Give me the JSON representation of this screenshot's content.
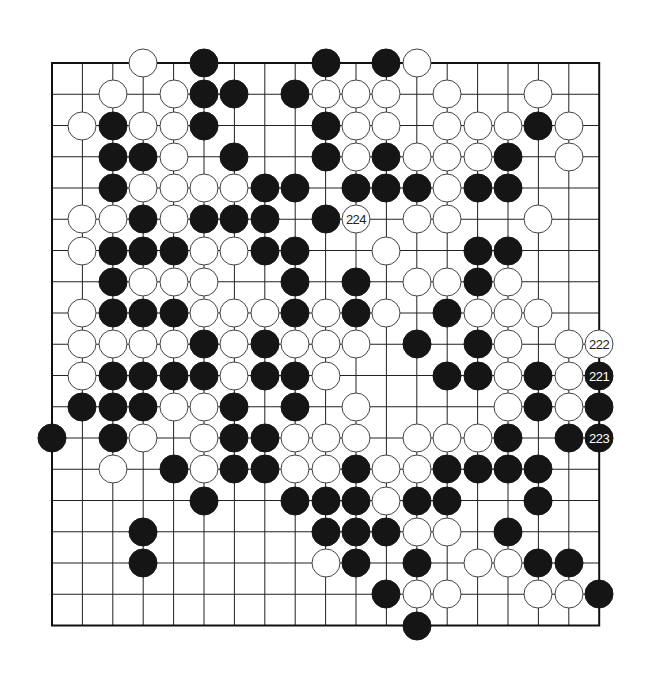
{
  "board": {
    "size": 19,
    "origin": {
      "x": 52,
      "y": 63
    },
    "spacing": {
      "x": 30.4,
      "y": 31.25
    },
    "line_color": "#222222",
    "border_color": "#111111",
    "stone_colors": {
      "black": "#151515",
      "white": "#ffffff"
    }
  },
  "stones": [
    {
      "r": 0,
      "c": 3,
      "color": "w"
    },
    {
      "r": 0,
      "c": 5,
      "color": "b"
    },
    {
      "r": 0,
      "c": 9,
      "color": "b"
    },
    {
      "r": 0,
      "c": 11,
      "color": "b"
    },
    {
      "r": 0,
      "c": 12,
      "color": "w"
    },
    {
      "r": 1,
      "c": 2,
      "color": "w"
    },
    {
      "r": 1,
      "c": 4,
      "color": "w"
    },
    {
      "r": 1,
      "c": 5,
      "color": "b"
    },
    {
      "r": 1,
      "c": 6,
      "color": "b"
    },
    {
      "r": 1,
      "c": 8,
      "color": "b"
    },
    {
      "r": 1,
      "c": 9,
      "color": "w"
    },
    {
      "r": 1,
      "c": 10,
      "color": "w"
    },
    {
      "r": 1,
      "c": 11,
      "color": "w"
    },
    {
      "r": 1,
      "c": 13,
      "color": "w"
    },
    {
      "r": 1,
      "c": 16,
      "color": "w"
    },
    {
      "r": 2,
      "c": 1,
      "color": "w"
    },
    {
      "r": 2,
      "c": 2,
      "color": "b"
    },
    {
      "r": 2,
      "c": 3,
      "color": "w"
    },
    {
      "r": 2,
      "c": 4,
      "color": "w"
    },
    {
      "r": 2,
      "c": 5,
      "color": "b"
    },
    {
      "r": 2,
      "c": 9,
      "color": "b"
    },
    {
      "r": 2,
      "c": 10,
      "color": "w"
    },
    {
      "r": 2,
      "c": 11,
      "color": "w"
    },
    {
      "r": 2,
      "c": 13,
      "color": "w"
    },
    {
      "r": 2,
      "c": 14,
      "color": "w"
    },
    {
      "r": 2,
      "c": 15,
      "color": "w"
    },
    {
      "r": 2,
      "c": 16,
      "color": "b"
    },
    {
      "r": 2,
      "c": 17,
      "color": "w"
    },
    {
      "r": 3,
      "c": 2,
      "color": "b"
    },
    {
      "r": 3,
      "c": 3,
      "color": "b"
    },
    {
      "r": 3,
      "c": 4,
      "color": "w"
    },
    {
      "r": 3,
      "c": 6,
      "color": "b"
    },
    {
      "r": 3,
      "c": 9,
      "color": "b"
    },
    {
      "r": 3,
      "c": 10,
      "color": "w"
    },
    {
      "r": 3,
      "c": 11,
      "color": "b"
    },
    {
      "r": 3,
      "c": 12,
      "color": "w"
    },
    {
      "r": 3,
      "c": 13,
      "color": "w"
    },
    {
      "r": 3,
      "c": 14,
      "color": "w"
    },
    {
      "r": 3,
      "c": 15,
      "color": "b"
    },
    {
      "r": 3,
      "c": 17,
      "color": "w"
    },
    {
      "r": 4,
      "c": 2,
      "color": "b"
    },
    {
      "r": 4,
      "c": 3,
      "color": "w"
    },
    {
      "r": 4,
      "c": 4,
      "color": "w"
    },
    {
      "r": 4,
      "c": 5,
      "color": "w"
    },
    {
      "r": 4,
      "c": 6,
      "color": "w"
    },
    {
      "r": 4,
      "c": 7,
      "color": "b"
    },
    {
      "r": 4,
      "c": 8,
      "color": "b"
    },
    {
      "r": 4,
      "c": 10,
      "color": "b"
    },
    {
      "r": 4,
      "c": 11,
      "color": "b"
    },
    {
      "r": 4,
      "c": 12,
      "color": "b"
    },
    {
      "r": 4,
      "c": 13,
      "color": "w"
    },
    {
      "r": 4,
      "c": 14,
      "color": "b"
    },
    {
      "r": 4,
      "c": 15,
      "color": "b"
    },
    {
      "r": 5,
      "c": 1,
      "color": "w"
    },
    {
      "r": 5,
      "c": 2,
      "color": "w"
    },
    {
      "r": 5,
      "c": 3,
      "color": "b"
    },
    {
      "r": 5,
      "c": 4,
      "color": "w"
    },
    {
      "r": 5,
      "c": 5,
      "color": "b"
    },
    {
      "r": 5,
      "c": 6,
      "color": "b"
    },
    {
      "r": 5,
      "c": 7,
      "color": "b"
    },
    {
      "r": 5,
      "c": 9,
      "color": "b"
    },
    {
      "r": 5,
      "c": 10,
      "color": "w",
      "label": "224"
    },
    {
      "r": 5,
      "c": 12,
      "color": "w"
    },
    {
      "r": 5,
      "c": 13,
      "color": "w"
    },
    {
      "r": 5,
      "c": 16,
      "color": "w"
    },
    {
      "r": 6,
      "c": 1,
      "color": "w"
    },
    {
      "r": 6,
      "c": 2,
      "color": "b"
    },
    {
      "r": 6,
      "c": 3,
      "color": "b"
    },
    {
      "r": 6,
      "c": 4,
      "color": "b"
    },
    {
      "r": 6,
      "c": 5,
      "color": "w"
    },
    {
      "r": 6,
      "c": 6,
      "color": "w"
    },
    {
      "r": 6,
      "c": 7,
      "color": "b"
    },
    {
      "r": 6,
      "c": 8,
      "color": "b"
    },
    {
      "r": 6,
      "c": 11,
      "color": "w"
    },
    {
      "r": 6,
      "c": 14,
      "color": "b"
    },
    {
      "r": 6,
      "c": 15,
      "color": "b"
    },
    {
      "r": 7,
      "c": 2,
      "color": "b"
    },
    {
      "r": 7,
      "c": 3,
      "color": "w"
    },
    {
      "r": 7,
      "c": 4,
      "color": "w"
    },
    {
      "r": 7,
      "c": 5,
      "color": "w"
    },
    {
      "r": 7,
      "c": 8,
      "color": "b"
    },
    {
      "r": 7,
      "c": 10,
      "color": "b"
    },
    {
      "r": 7,
      "c": 12,
      "color": "w"
    },
    {
      "r": 7,
      "c": 13,
      "color": "w"
    },
    {
      "r": 7,
      "c": 14,
      "color": "b"
    },
    {
      "r": 7,
      "c": 15,
      "color": "w"
    },
    {
      "r": 8,
      "c": 1,
      "color": "w"
    },
    {
      "r": 8,
      "c": 2,
      "color": "b"
    },
    {
      "r": 8,
      "c": 3,
      "color": "b"
    },
    {
      "r": 8,
      "c": 4,
      "color": "b"
    },
    {
      "r": 8,
      "c": 5,
      "color": "w"
    },
    {
      "r": 8,
      "c": 6,
      "color": "w"
    },
    {
      "r": 8,
      "c": 7,
      "color": "w"
    },
    {
      "r": 8,
      "c": 8,
      "color": "b"
    },
    {
      "r": 8,
      "c": 9,
      "color": "w"
    },
    {
      "r": 8,
      "c": 10,
      "color": "b"
    },
    {
      "r": 8,
      "c": 11,
      "color": "w"
    },
    {
      "r": 8,
      "c": 13,
      "color": "b"
    },
    {
      "r": 8,
      "c": 14,
      "color": "w"
    },
    {
      "r": 8,
      "c": 15,
      "color": "w"
    },
    {
      "r": 8,
      "c": 16,
      "color": "w"
    },
    {
      "r": 9,
      "c": 1,
      "color": "w"
    },
    {
      "r": 9,
      "c": 2,
      "color": "w"
    },
    {
      "r": 9,
      "c": 3,
      "color": "w"
    },
    {
      "r": 9,
      "c": 4,
      "color": "w"
    },
    {
      "r": 9,
      "c": 5,
      "color": "b"
    },
    {
      "r": 9,
      "c": 6,
      "color": "w"
    },
    {
      "r": 9,
      "c": 7,
      "color": "b"
    },
    {
      "r": 9,
      "c": 8,
      "color": "w"
    },
    {
      "r": 9,
      "c": 9,
      "color": "w"
    },
    {
      "r": 9,
      "c": 10,
      "color": "w"
    },
    {
      "r": 9,
      "c": 12,
      "color": "b"
    },
    {
      "r": 9,
      "c": 14,
      "color": "b"
    },
    {
      "r": 9,
      "c": 15,
      "color": "w"
    },
    {
      "r": 9,
      "c": 17,
      "color": "w"
    },
    {
      "r": 9,
      "c": 18,
      "color": "w",
      "label": "222"
    },
    {
      "r": 10,
      "c": 1,
      "color": "w"
    },
    {
      "r": 10,
      "c": 2,
      "color": "b"
    },
    {
      "r": 10,
      "c": 3,
      "color": "b"
    },
    {
      "r": 10,
      "c": 4,
      "color": "b"
    },
    {
      "r": 10,
      "c": 5,
      "color": "b"
    },
    {
      "r": 10,
      "c": 6,
      "color": "w"
    },
    {
      "r": 10,
      "c": 7,
      "color": "b"
    },
    {
      "r": 10,
      "c": 8,
      "color": "b"
    },
    {
      "r": 10,
      "c": 9,
      "color": "w"
    },
    {
      "r": 10,
      "c": 13,
      "color": "b"
    },
    {
      "r": 10,
      "c": 14,
      "color": "b"
    },
    {
      "r": 10,
      "c": 15,
      "color": "w"
    },
    {
      "r": 10,
      "c": 16,
      "color": "b"
    },
    {
      "r": 10,
      "c": 17,
      "color": "w"
    },
    {
      "r": 10,
      "c": 18,
      "color": "b",
      "label": "221"
    },
    {
      "r": 11,
      "c": 1,
      "color": "b"
    },
    {
      "r": 11,
      "c": 2,
      "color": "b"
    },
    {
      "r": 11,
      "c": 3,
      "color": "b"
    },
    {
      "r": 11,
      "c": 4,
      "color": "w"
    },
    {
      "r": 11,
      "c": 5,
      "color": "w"
    },
    {
      "r": 11,
      "c": 6,
      "color": "b"
    },
    {
      "r": 11,
      "c": 8,
      "color": "b"
    },
    {
      "r": 11,
      "c": 10,
      "color": "w"
    },
    {
      "r": 11,
      "c": 15,
      "color": "w"
    },
    {
      "r": 11,
      "c": 16,
      "color": "b"
    },
    {
      "r": 11,
      "c": 17,
      "color": "w"
    },
    {
      "r": 11,
      "c": 18,
      "color": "b"
    },
    {
      "r": 12,
      "c": 0,
      "color": "b"
    },
    {
      "r": 12,
      "c": 2,
      "color": "b"
    },
    {
      "r": 12,
      "c": 3,
      "color": "w"
    },
    {
      "r": 12,
      "c": 5,
      "color": "w"
    },
    {
      "r": 12,
      "c": 6,
      "color": "b"
    },
    {
      "r": 12,
      "c": 7,
      "color": "b"
    },
    {
      "r": 12,
      "c": 8,
      "color": "w"
    },
    {
      "r": 12,
      "c": 9,
      "color": "w"
    },
    {
      "r": 12,
      "c": 10,
      "color": "w"
    },
    {
      "r": 12,
      "c": 12,
      "color": "w"
    },
    {
      "r": 12,
      "c": 13,
      "color": "w"
    },
    {
      "r": 12,
      "c": 14,
      "color": "w"
    },
    {
      "r": 12,
      "c": 15,
      "color": "b"
    },
    {
      "r": 12,
      "c": 17,
      "color": "b"
    },
    {
      "r": 12,
      "c": 18,
      "color": "b",
      "label": "223"
    },
    {
      "r": 13,
      "c": 2,
      "color": "w"
    },
    {
      "r": 13,
      "c": 4,
      "color": "b"
    },
    {
      "r": 13,
      "c": 5,
      "color": "w"
    },
    {
      "r": 13,
      "c": 6,
      "color": "b"
    },
    {
      "r": 13,
      "c": 7,
      "color": "b"
    },
    {
      "r": 13,
      "c": 8,
      "color": "w"
    },
    {
      "r": 13,
      "c": 9,
      "color": "w"
    },
    {
      "r": 13,
      "c": 10,
      "color": "b"
    },
    {
      "r": 13,
      "c": 11,
      "color": "w"
    },
    {
      "r": 13,
      "c": 12,
      "color": "w"
    },
    {
      "r": 13,
      "c": 13,
      "color": "b"
    },
    {
      "r": 13,
      "c": 14,
      "color": "b"
    },
    {
      "r": 13,
      "c": 15,
      "color": "b"
    },
    {
      "r": 13,
      "c": 16,
      "color": "b"
    },
    {
      "r": 14,
      "c": 5,
      "color": "b"
    },
    {
      "r": 14,
      "c": 8,
      "color": "b"
    },
    {
      "r": 14,
      "c": 9,
      "color": "b"
    },
    {
      "r": 14,
      "c": 10,
      "color": "b"
    },
    {
      "r": 14,
      "c": 11,
      "color": "w"
    },
    {
      "r": 14,
      "c": 12,
      "color": "b"
    },
    {
      "r": 14,
      "c": 13,
      "color": "b"
    },
    {
      "r": 14,
      "c": 16,
      "color": "b"
    },
    {
      "r": 15,
      "c": 3,
      "color": "b"
    },
    {
      "r": 15,
      "c": 9,
      "color": "b"
    },
    {
      "r": 15,
      "c": 10,
      "color": "b"
    },
    {
      "r": 15,
      "c": 11,
      "color": "b"
    },
    {
      "r": 15,
      "c": 12,
      "color": "w"
    },
    {
      "r": 15,
      "c": 13,
      "color": "w"
    },
    {
      "r": 15,
      "c": 15,
      "color": "b"
    },
    {
      "r": 16,
      "c": 3,
      "color": "b"
    },
    {
      "r": 16,
      "c": 9,
      "color": "w"
    },
    {
      "r": 16,
      "c": 10,
      "color": "b"
    },
    {
      "r": 16,
      "c": 12,
      "color": "b"
    },
    {
      "r": 16,
      "c": 14,
      "color": "w"
    },
    {
      "r": 16,
      "c": 15,
      "color": "w"
    },
    {
      "r": 16,
      "c": 16,
      "color": "b"
    },
    {
      "r": 16,
      "c": 17,
      "color": "b"
    },
    {
      "r": 17,
      "c": 11,
      "color": "b"
    },
    {
      "r": 17,
      "c": 12,
      "color": "w"
    },
    {
      "r": 17,
      "c": 13,
      "color": "w"
    },
    {
      "r": 17,
      "c": 16,
      "color": "w"
    },
    {
      "r": 17,
      "c": 17,
      "color": "w"
    },
    {
      "r": 17,
      "c": 18,
      "color": "b"
    },
    {
      "r": 18,
      "c": 12,
      "color": "b"
    }
  ],
  "move_labels": [
    "221",
    "222",
    "223",
    "224"
  ]
}
